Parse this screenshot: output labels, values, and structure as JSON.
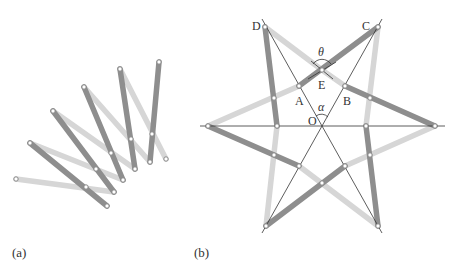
{
  "figure": {
    "panels": [
      {
        "id": "a",
        "caption": "(a)"
      },
      {
        "id": "b",
        "caption": "(b)"
      }
    ]
  },
  "panel_b": {
    "points": {
      "A": "A",
      "B": "B",
      "C": "C",
      "D": "D",
      "E": "E",
      "O": "O"
    },
    "angles": {
      "theta": "θ",
      "alpha": "α"
    }
  },
  "colors": {
    "dark_bar": "#8c8c8c",
    "light_bar": "#d4d4d4",
    "line": "#333333",
    "joint_fill": "#ffffff"
  }
}
